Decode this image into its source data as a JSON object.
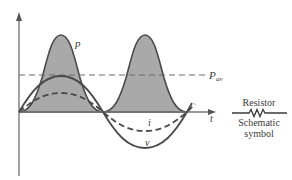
{
  "diagram": {
    "colors": {
      "background": "#ffffff",
      "power_fill": "#a9a9a9",
      "curve_stroke": "#4a4a4a",
      "axis": "#555555",
      "dashed": "#6a6a6a",
      "text": "#3a3a3a"
    },
    "labels": {
      "power": "p",
      "average_power_main": "P",
      "average_power_sub": "av",
      "current": "i",
      "voltage": "v",
      "time_axis": "t"
    },
    "legend": {
      "component_name": "Resistor",
      "caption_line1": "Schematic",
      "caption_line2": "symbol"
    },
    "curves": [
      {
        "name": "p",
        "style": "solid, filled gray",
        "description": "instantaneous power, sin² shape, two positive humps"
      },
      {
        "name": "v",
        "style": "solid",
        "description": "voltage sinusoid"
      },
      {
        "name": "i",
        "style": "dashed",
        "description": "current sinusoid, in phase with v, smaller amplitude"
      },
      {
        "name": "P_av",
        "style": "dashed horizontal",
        "description": "average power level, half of peak p"
      }
    ]
  }
}
